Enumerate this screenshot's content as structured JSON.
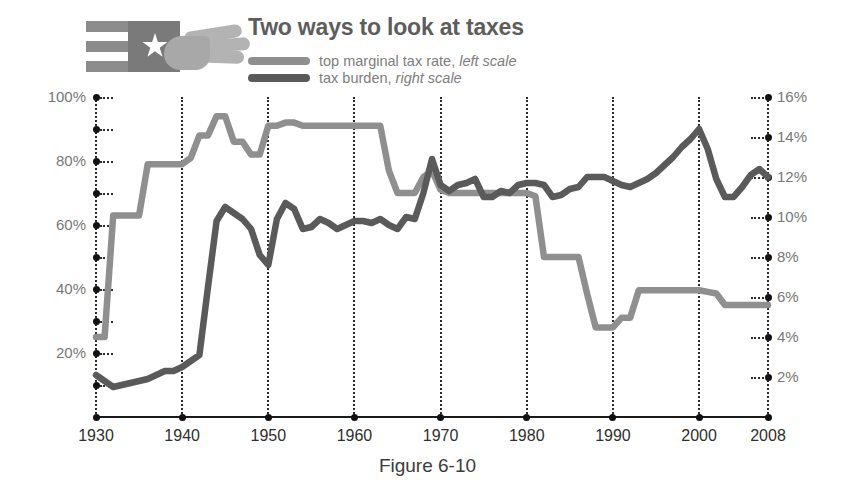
{
  "header": {
    "title": "Two ways to look at taxes",
    "logo_name": "flag-and-hand-logo"
  },
  "legend": {
    "items": [
      {
        "label_main": "top marginal tax rate,",
        "label_em": "left scale",
        "color": "#8f8f8f",
        "axis": "left"
      },
      {
        "label_main": "tax burden,",
        "label_em": "right scale",
        "color": "#5a5a5a",
        "axis": "right"
      }
    ]
  },
  "caption": "Figure 6-10",
  "axes": {
    "left_ticks": [
      "100%",
      "80%",
      "60%",
      "40%",
      "20%"
    ],
    "left_tick_values": [
      100,
      80,
      60,
      40,
      20
    ],
    "left_minor_values": [
      90,
      70,
      50,
      30,
      10
    ],
    "right_ticks": [
      "16%",
      "14%",
      "12%",
      "10%",
      "8%",
      "6%",
      "4%",
      "2%"
    ],
    "right_tick_values": [
      16,
      14,
      12,
      10,
      8,
      6,
      4,
      2
    ],
    "x_ticks": [
      "1930",
      "1940",
      "1950",
      "1960",
      "1970",
      "1980",
      "1990",
      "2000",
      "2008"
    ],
    "x_tick_values": [
      1930,
      1940,
      1950,
      1960,
      1970,
      1980,
      1990,
      2000,
      2008
    ]
  },
  "chart_data": {
    "type": "line",
    "title": "Two ways to look at taxes",
    "xlabel": "",
    "ylabel": "top marginal tax rate",
    "y2label": "tax burden",
    "xlim": [
      1930,
      2008
    ],
    "ylim": [
      0,
      100
    ],
    "y2lim": [
      0,
      16
    ],
    "grid": "dotted vertical gridlines at each decade; dotted tick marks on both value axes",
    "legend_position": "top-center",
    "x": [
      1930,
      1931,
      1932,
      1933,
      1934,
      1935,
      1936,
      1937,
      1938,
      1939,
      1940,
      1941,
      1942,
      1943,
      1944,
      1945,
      1946,
      1947,
      1948,
      1949,
      1950,
      1951,
      1952,
      1953,
      1954,
      1955,
      1956,
      1957,
      1958,
      1959,
      1960,
      1961,
      1962,
      1963,
      1964,
      1965,
      1966,
      1967,
      1968,
      1969,
      1970,
      1971,
      1972,
      1973,
      1974,
      1975,
      1976,
      1977,
      1978,
      1979,
      1980,
      1981,
      1982,
      1983,
      1984,
      1985,
      1986,
      1987,
      1988,
      1989,
      1990,
      1991,
      1992,
      1993,
      1994,
      1995,
      1996,
      1997,
      1998,
      1999,
      2000,
      2001,
      2002,
      2003,
      2004,
      2005,
      2006,
      2007,
      2008
    ],
    "series": [
      {
        "name": "top marginal tax rate, left scale",
        "axis": "left",
        "color": "#8f8f8f",
        "unit": "%",
        "values": [
          25,
          25,
          63,
          63,
          63,
          63,
          79,
          79,
          79,
          79,
          79,
          81,
          88,
          88,
          94,
          94,
          86,
          86,
          82,
          82,
          91,
          91,
          92,
          92,
          91,
          91,
          91,
          91,
          91,
          91,
          91,
          91,
          91,
          91,
          77,
          70,
          70,
          70,
          75,
          77,
          71,
          70,
          70,
          70,
          70,
          70,
          70,
          70,
          70,
          70,
          70,
          69,
          50,
          50,
          50,
          50,
          50,
          38.5,
          28,
          28,
          28,
          31,
          31,
          39.6,
          39.6,
          39.6,
          39.6,
          39.6,
          39.6,
          39.6,
          39.6,
          39.1,
          38.6,
          35,
          35,
          35,
          35,
          35,
          35
        ]
      },
      {
        "name": "tax burden, right scale",
        "axis": "right",
        "color": "#5a5a5a",
        "unit": "%",
        "values": [
          2.1,
          1.8,
          1.5,
          1.6,
          1.7,
          1.8,
          1.9,
          2.1,
          2.3,
          2.3,
          2.5,
          2.8,
          3.1,
          6.5,
          9.8,
          10.5,
          10.2,
          9.9,
          9.4,
          8.1,
          7.6,
          9.9,
          10.7,
          10.4,
          9.4,
          9.5,
          9.9,
          9.7,
          9.4,
          9.6,
          9.8,
          9.8,
          9.7,
          9.9,
          9.6,
          9.4,
          10.0,
          9.9,
          11.2,
          12.9,
          11.6,
          11.3,
          11.6,
          11.7,
          11.9,
          11.0,
          11.0,
          11.3,
          11.2,
          11.6,
          11.7,
          11.7,
          11.6,
          11.0,
          11.1,
          11.4,
          11.5,
          12.0,
          12.0,
          12.0,
          11.8,
          11.6,
          11.5,
          11.7,
          11.9,
          12.2,
          12.6,
          13.0,
          13.5,
          13.9,
          14.4,
          13.4,
          11.9,
          11.0,
          11.0,
          11.5,
          12.1,
          12.4,
          12.0
        ]
      }
    ]
  }
}
